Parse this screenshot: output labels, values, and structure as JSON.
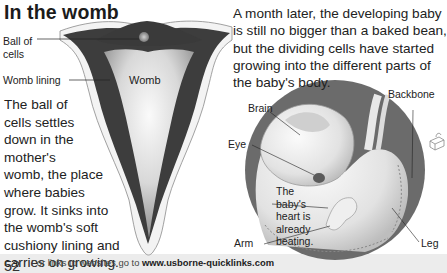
{
  "page": {
    "title": "In the womb",
    "page_number": "52"
  },
  "womb_diagram": {
    "labels": {
      "ball_of_cells_line1": "Ball of",
      "ball_of_cells_line2": "cells",
      "womb_lining": "Womb lining",
      "womb": "Womb"
    }
  },
  "left_text": {
    "lines": [
      "The ball of",
      "cells settles",
      "down in the",
      "mother's",
      "womb, the place",
      "where babies",
      "grow. It sinks into",
      "the womb's  soft",
      "cushiony lining and",
      "carries on growing."
    ]
  },
  "intro_text": {
    "lines": [
      "A month later, the developing baby",
      "is still no bigger than a baked bean,",
      "but the dividing cells have started",
      "growing into the different parts of",
      "the baby's body."
    ]
  },
  "embryo_diagram": {
    "labels": {
      "brain": "Brain",
      "eye": "Eye",
      "backbone": "Backbone",
      "arm": "Arm",
      "leg": "Leg"
    },
    "heart_note": [
      "The",
      "baby's",
      "heart is",
      "already",
      "beating."
    ]
  },
  "footer": {
    "prefix": "For links to websites go to ",
    "link": "www.usborne-quicklinks.com"
  },
  "icons": {
    "quicklinks": "computer-mouse-icon"
  }
}
